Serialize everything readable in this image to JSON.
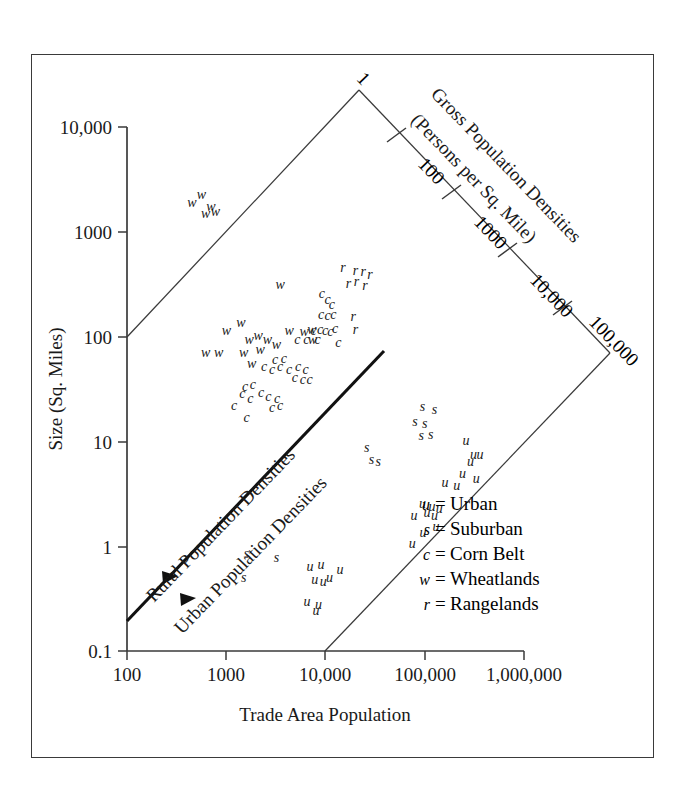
{
  "chart_data": {
    "type": "scatter",
    "title": "",
    "xlabel": "Trade Area Population",
    "ylabel": "Size (Sq. Miles)",
    "xscale": "log",
    "yscale": "log",
    "xlim": [
      100,
      1000000
    ],
    "ylim": [
      0.1,
      100000
    ],
    "grid": false,
    "legend_position": "inside-bottom-right",
    "x_tick_labels": [
      "100",
      "1000",
      "10,000",
      "100,000",
      "1,000,000"
    ],
    "x_tick_values": [
      100,
      1000,
      10000,
      100000,
      1000000
    ],
    "y_tick_labels": [
      "10,000",
      "1000",
      "100",
      "10",
      "1",
      "0.1"
    ],
    "y_tick_values": [
      10000,
      1000,
      100,
      10,
      1,
      0.1
    ],
    "diagonal_axis": {
      "label_line1": "Gross Population Densities",
      "label_line2": "(Persons per Sq. Mile)",
      "tick_labels": [
        "1",
        "100",
        "1000",
        "10,000",
        "100,000"
      ],
      "tick_values": [
        1,
        100,
        1000,
        10000,
        100000
      ]
    },
    "band_labels": [
      {
        "text": "Rural Population Densities"
      },
      {
        "text": "Urban Population Densities"
      }
    ],
    "legend": [
      {
        "symbol": "u",
        "equals": "=",
        "name": "Urban"
      },
      {
        "symbol": "s",
        "equals": "=",
        "name": "Suburban"
      },
      {
        "symbol": "c",
        "equals": "=",
        "name": "Corn Belt"
      },
      {
        "symbol": "w",
        "equals": "=",
        "name": "Wheatlands"
      },
      {
        "symbol": "r",
        "equals": "=",
        "name": "Rangelands"
      }
    ],
    "series": [
      {
        "name": "Wheatlands",
        "marker": "w",
        "points": [
          [
            450,
            12000
          ],
          [
            560,
            15000
          ],
          [
            700,
            11000
          ],
          [
            620,
            9000
          ],
          [
            780,
            9500
          ],
          [
            3500,
            1400
          ],
          [
            1400,
            520
          ],
          [
            1000,
            420
          ],
          [
            1700,
            330
          ],
          [
            2100,
            360
          ],
          [
            2600,
            330
          ],
          [
            3200,
            290
          ],
          [
            4300,
            420
          ],
          [
            6100,
            410
          ],
          [
            7300,
            430
          ],
          [
            7400,
            330
          ],
          [
            620,
            230
          ],
          [
            840,
            230
          ],
          [
            1500,
            230
          ],
          [
            2200,
            250
          ],
          [
            1800,
            175
          ]
        ]
      },
      {
        "name": "Corn Belt",
        "marker": "c",
        "points": [
          [
            5200,
            330
          ],
          [
            6400,
            330
          ],
          [
            9200,
            1100
          ],
          [
            10500,
            950
          ],
          [
            11600,
            820
          ],
          [
            9000,
            640
          ],
          [
            10500,
            620
          ],
          [
            12000,
            640
          ],
          [
            7600,
            420
          ],
          [
            8800,
            430
          ],
          [
            9900,
            420
          ],
          [
            11200,
            400
          ],
          [
            12500,
            440
          ],
          [
            8300,
            330
          ],
          [
            3100,
            195
          ],
          [
            3800,
            200
          ],
          [
            2400,
            160
          ],
          [
            2900,
            150
          ],
          [
            3500,
            160
          ],
          [
            4300,
            150
          ],
          [
            5300,
            160
          ],
          [
            6300,
            150
          ],
          [
            4900,
            120
          ],
          [
            5900,
            115
          ],
          [
            1550,
            96
          ],
          [
            1850,
            100
          ],
          [
            2250,
            82
          ],
          [
            1450,
            80
          ],
          [
            1750,
            70
          ],
          [
            2650,
            73
          ],
          [
            3250,
            70
          ],
          [
            1200,
            58
          ],
          [
            2900,
            55
          ],
          [
            3500,
            57
          ],
          [
            6900,
            115
          ],
          [
            1600,
            42
          ],
          [
            13500,
            300
          ]
        ]
      },
      {
        "name": "Rangelands",
        "marker": "r",
        "points": [
          [
            15000,
            2200
          ],
          [
            20000,
            2000
          ],
          [
            24000,
            1950
          ],
          [
            28000,
            1800
          ],
          [
            20500,
            1500
          ],
          [
            17000,
            1450
          ],
          [
            25000,
            1350
          ],
          [
            19000,
            600
          ],
          [
            20000,
            430
          ]
        ]
      },
      {
        "name": "Suburban",
        "marker": "s",
        "points": [
          [
            95000,
            56
          ],
          [
            125000,
            52
          ],
          [
            80000,
            38
          ],
          [
            100000,
            36
          ],
          [
            92000,
            26
          ],
          [
            115000,
            27
          ],
          [
            26000,
            19
          ],
          [
            29000,
            14
          ],
          [
            34000,
            13
          ],
          [
            1600,
            1.15
          ],
          [
            3200,
            1.05
          ],
          [
            1500,
            0.62
          ]
        ]
      },
      {
        "name": "Urban",
        "marker": "u",
        "points": [
          [
            260000,
            23
          ],
          [
            310000,
            16
          ],
          [
            360000,
            16
          ],
          [
            290000,
            13
          ],
          [
            240000,
            9.5
          ],
          [
            330000,
            8.5
          ],
          [
            160000,
            7.5
          ],
          [
            210000,
            7.0
          ],
          [
            95000,
            4.3
          ],
          [
            118000,
            4.0
          ],
          [
            140000,
            3.8
          ],
          [
            105000,
            3.4
          ],
          [
            125000,
            3.2
          ],
          [
            78000,
            3.2
          ],
          [
            130000,
            2.4
          ],
          [
            96000,
            2.0
          ],
          [
            75000,
            1.5
          ],
          [
            7000,
            0.82
          ],
          [
            9000,
            0.88
          ],
          [
            14000,
            0.76
          ],
          [
            11000,
            0.62
          ],
          [
            7800,
            0.58
          ],
          [
            9500,
            0.55
          ],
          [
            6500,
            0.33
          ],
          [
            8500,
            0.3
          ],
          [
            8000,
            0.26
          ]
        ]
      }
    ]
  }
}
